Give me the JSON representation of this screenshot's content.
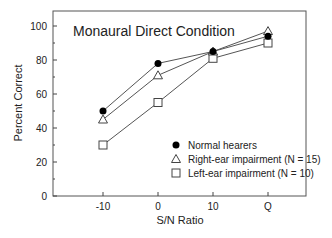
{
  "chart_data": {
    "type": "line",
    "title": "Monaural Direct Condition",
    "xlabel": "S/N Ratio",
    "ylabel": "Percent Correct",
    "categories": [
      "-10",
      "0",
      "10",
      "Q"
    ],
    "ylim": [
      0,
      100
    ],
    "yticks": [
      0,
      20,
      40,
      60,
      80,
      100
    ],
    "grid": false,
    "legend_position": "lower right",
    "series": [
      {
        "name": "Normal hearers",
        "marker": "filled-circle",
        "values": [
          50,
          78,
          85,
          94
        ]
      },
      {
        "name": "Right-ear impairment (N = 15)",
        "marker": "open-triangle",
        "values": [
          45,
          71,
          85,
          97
        ]
      },
      {
        "name": "Left-ear impairment (N = 10)",
        "marker": "open-square",
        "values": [
          30,
          55,
          81,
          90
        ]
      }
    ]
  },
  "colors": {
    "line": "#555555",
    "axis": "#444444",
    "marker_fill": "#000000"
  }
}
